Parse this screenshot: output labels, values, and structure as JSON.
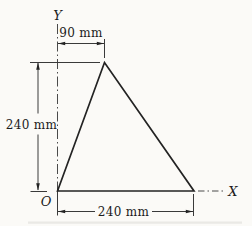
{
  "diagram": {
    "kind": "triangle-coordinate-diagram",
    "axes": {
      "y_label": "Y",
      "x_label": "X",
      "origin_label": "O"
    },
    "dimensions": {
      "top_width": "90 mm",
      "left_height": "240 mm",
      "bottom_width": "240 mm"
    },
    "figure": {
      "type": "triangle",
      "vertices_mm": [
        [
          0,
          0
        ],
        [
          240,
          0
        ],
        [
          90,
          240
        ]
      ]
    },
    "colors": {
      "background": "#fbfaf7",
      "line": "#232323",
      "thin_line": "#3a3a3a",
      "text": "#1c1c1c"
    }
  }
}
